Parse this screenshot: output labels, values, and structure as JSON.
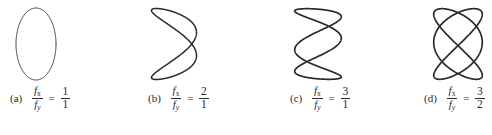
{
  "figure": {
    "background_color": "#ffffff",
    "stroke_color": "#2a2a2a",
    "width": 492,
    "height": 135
  },
  "symbols": {
    "f": "f",
    "sub_x": "x",
    "sub_y": "y",
    "equals": "="
  },
  "panels": [
    {
      "tag": "(a)",
      "numerator": "1",
      "denominator": "1",
      "fx": 1,
      "fy": 1,
      "phase_deg": 90,
      "stroke_width": 1.0,
      "shape": "ellipse",
      "box": {
        "left": 14,
        "top": 6,
        "width": 44,
        "height": 76
      },
      "caption_left": 10
    },
    {
      "tag": "(b)",
      "numerator": "2",
      "denominator": "1",
      "fx": 2,
      "fy": 1,
      "phase_deg": 52,
      "stroke_width": 1.5,
      "shape": "lissajous",
      "box": {
        "left": 149,
        "top": 6,
        "width": 50,
        "height": 76
      },
      "caption_left": 148
    },
    {
      "tag": "(c)",
      "numerator": "3",
      "denominator": "1",
      "fx": 3,
      "fy": 1,
      "phase_deg": 62,
      "stroke_width": 1.7,
      "shape": "lissajous",
      "box": {
        "left": 292,
        "top": 6,
        "width": 52,
        "height": 76
      },
      "caption_left": 290
    },
    {
      "tag": "(d)",
      "numerator": "3",
      "denominator": "2",
      "fx": 3,
      "fy": 2,
      "phase_deg": 86,
      "stroke_width": 1.7,
      "shape": "lissajous",
      "box": {
        "left": 431,
        "top": 6,
        "width": 54,
        "height": 76
      },
      "caption_left": 424
    }
  ],
  "chart_data": {
    "type": "line",
    "xlabel": "",
    "ylabel": "",
    "grid": false,
    "legend_position": "none",
    "series": [
      {
        "name": "(a) fx/fy = 1/1",
        "fx": 1,
        "fy": 1,
        "ratio": "1/1",
        "description": "closed ellipse, single loop, no crossings"
      },
      {
        "name": "(b) fx/fy = 2/1",
        "fx": 2,
        "fy": 1,
        "ratio": "2/1",
        "description": "two vertical lobes with one interior crossing"
      },
      {
        "name": "(c) fx/fy = 3/1",
        "fx": 3,
        "fy": 1,
        "ratio": "3/1",
        "description": "three vertical lobes, zigzag with two crossings"
      },
      {
        "name": "(d) fx/fy = 3/2",
        "fx": 3,
        "fy": 2,
        "ratio": "3/2",
        "description": "woven lattice pattern with multiple crossings"
      }
    ]
  }
}
